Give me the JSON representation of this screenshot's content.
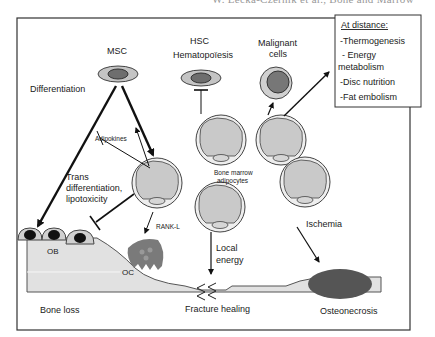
{
  "header": {
    "running_title": "W. Lecka-Czernik et al., Bone and Marrow"
  },
  "diagram": {
    "nodes": {
      "msc": "MSC",
      "hsc": "HSC",
      "hematopoiesis": "Hematopoïesis",
      "malignant_1": "Malignant",
      "malignant_2": "cells",
      "differentiation": "Differentiation",
      "adipokines": "Adipokines",
      "trans_1": "Trans",
      "trans_2": "differentiation,",
      "trans_3": "lipotoxicity",
      "bma_1": "Bone marrow",
      "bma_2": "adipocytes",
      "rankl": "RANK-L",
      "ob": "OB",
      "oc": "OC",
      "local_1": "Local",
      "local_2": "energy",
      "ischemia": "Ischemia"
    },
    "outcomes": {
      "bone_loss": "Bone loss",
      "fracture_healing": "Fracture healing",
      "osteonecrosis": "Osteonecrosis"
    },
    "distance_box": {
      "title": "At distance:",
      "items": [
        {
          "label": "Thermogenesis"
        },
        {
          "label": "Energy",
          "label2": "metabolism"
        },
        {
          "label": "Disc nutrition"
        },
        {
          "label": "Fat embolism"
        }
      ]
    },
    "colors": {
      "frame": "#333333",
      "cell_fill": "#c8c8c8",
      "cell_outer": "#e6e6e6",
      "stem_outer": "#c4c4c4",
      "stem_inner": "#6e6e6e",
      "bone_fill": "#e1e1e1",
      "osteonecrosis": "#555555",
      "oc_fill": "#7a7a7a",
      "ob_nucleus": "#111111"
    }
  }
}
